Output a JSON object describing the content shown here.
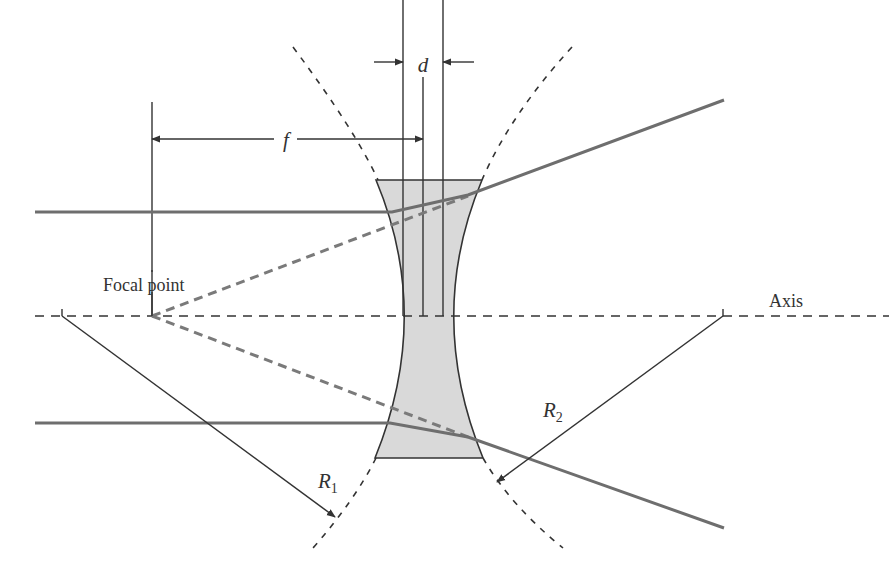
{
  "diagram": {
    "type": "diverging (biconcave) lens ray diagram",
    "labels": {
      "focal_point": "Focal point",
      "axis": "Axis",
      "focal_length": "f",
      "thickness": "d",
      "radius1": "R",
      "radius1_sub": "1",
      "radius2": "R",
      "radius2_sub": "2"
    },
    "colors": {
      "lens_fill": "#d9d9d9",
      "line": "#333333",
      "ray": "#6e6e6e",
      "virtual_ray": "#7a7a7a",
      "background": "#ffffff"
    },
    "elements": [
      "optical axis (dashed)",
      "biconcave lens (gray fill)",
      "two incident parallel rays",
      "two diverging refracted rays",
      "virtual rays traced back to focal point (dashed)",
      "radius of curvature arrows R1 and R2",
      "surface arcs (dashed)",
      "focal length dimension f",
      "lens thickness dimension d"
    ]
  }
}
